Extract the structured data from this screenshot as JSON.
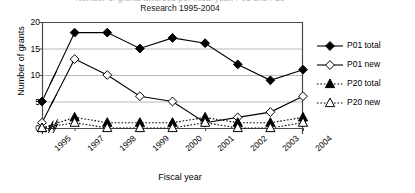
{
  "chart_data": {
    "type": "line",
    "title": "Research 1995-2004",
    "title_clipped": "Number of grants awarded per fiscal year, P01 and P20",
    "xlabel": "Fiscal year",
    "ylabel": "Number of grants",
    "categories": [
      "1995",
      "1997",
      "1998",
      "1999",
      "2000",
      "2001",
      "2002",
      "2003",
      "2004"
    ],
    "ylim": [
      0,
      20
    ],
    "yticks": [
      0,
      5,
      10,
      15,
      20
    ],
    "grid": true,
    "axis_break": true,
    "axis_break_note": "1996 omitted; double-slash break marks drawn on each series between 1995 and 1997",
    "legend_position": "right",
    "series": [
      {
        "name": "P01 total",
        "marker": "filled-diamond",
        "line": "solid",
        "values": [
          5,
          18,
          18,
          15,
          17,
          16,
          12,
          9,
          11
        ]
      },
      {
        "name": "P01 new",
        "marker": "open-diamond",
        "line": "solid",
        "values": [
          1,
          13,
          10,
          6,
          5,
          1,
          2,
          3,
          6
        ]
      },
      {
        "name": "P20 total",
        "marker": "filled-triangle",
        "line": "dotted",
        "values": [
          0,
          2,
          1,
          1,
          1,
          2,
          1,
          1,
          2
        ]
      },
      {
        "name": "P20 new",
        "marker": "open-triangle",
        "line": "dotted",
        "values": [
          0,
          1,
          0,
          0,
          0,
          1,
          0,
          0,
          1
        ]
      }
    ]
  },
  "legend": {
    "items": [
      {
        "label": "P01 total"
      },
      {
        "label": "P01 new"
      },
      {
        "label": "P20 total"
      },
      {
        "label": "P20 new"
      }
    ]
  }
}
